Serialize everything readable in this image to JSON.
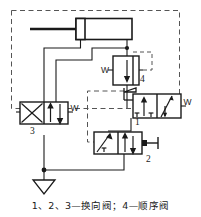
{
  "figure": {
    "kind": "hydraulic-circuit-schematic",
    "caption": "1、2、3—换向阀；4—顺序阀",
    "colors": {
      "line": "#1a1a1a",
      "dashed": "#555555",
      "background": "#ffffff",
      "text": "#1a1a1a"
    }
  },
  "components": {
    "cylinder": {
      "name": "double-acting-cylinder",
      "label": ""
    },
    "valve1": {
      "label": "1",
      "name": "directional-control-valve-1",
      "actuator_left": "lever",
      "actuator_right": "spring",
      "spring_label": "W",
      "positions": 2
    },
    "valve2": {
      "label": "2",
      "name": "directional-control-valve-2",
      "actuator_right": "plunger",
      "positions": 2
    },
    "valve3": {
      "label": "3",
      "name": "directional-control-valve-3",
      "actuator_right": "spring",
      "spring_label": "W",
      "positions": 2
    },
    "valve4": {
      "label": "4",
      "name": "sequence-valve-4",
      "spring_label": "W",
      "positions": 1
    },
    "tank": {
      "name": "reservoir-tank",
      "label": ""
    }
  },
  "labels": {
    "w_valve1": "W",
    "w_valve3": "W",
    "w_valve4": "W",
    "n1": "1",
    "n2": "2",
    "n3": "3",
    "n4": "4"
  }
}
